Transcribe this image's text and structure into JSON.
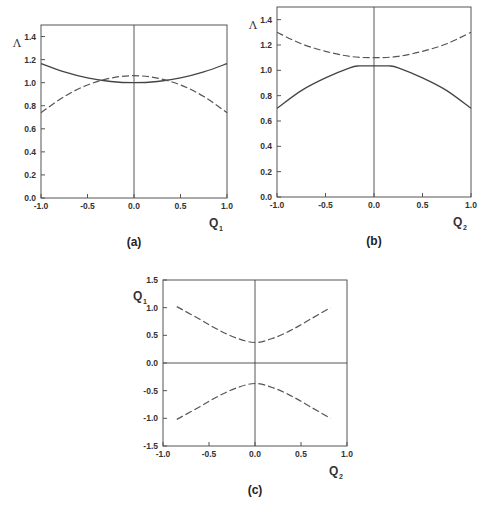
{
  "chart_data": [
    {
      "id": "a",
      "type": "line",
      "caption": "(a)",
      "xlabel": "Q",
      "xlabel_sub": "1",
      "ylabel": "Λ",
      "xlim": [
        -1.0,
        1.0
      ],
      "ylim": [
        0.0,
        1.5
      ],
      "xticks": [
        "-1.0",
        "-0.5",
        "0.0",
        "0.5",
        "1.0"
      ],
      "yticks": [
        "0.0",
        "0.2",
        "0.4",
        "0.6",
        "0.8",
        "1.0",
        "1.2",
        "1.4"
      ],
      "grid": false,
      "frame_px": {
        "left": 41,
        "right": 227,
        "top": 25,
        "bottom": 198
      },
      "series": [
        {
          "name": "solid",
          "style": "solid",
          "x": [
            -1.0,
            -0.75,
            -0.5,
            -0.25,
            0.0,
            0.25,
            0.5,
            0.75,
            1.0
          ],
          "y": [
            1.165,
            1.093,
            1.041,
            1.01,
            1.0,
            1.01,
            1.041,
            1.093,
            1.165
          ]
        },
        {
          "name": "dashed",
          "style": "dashed",
          "x": [
            -1.0,
            -0.75,
            -0.5,
            -0.25,
            0.0,
            0.25,
            0.5,
            0.75,
            1.0
          ],
          "y": [
            0.74,
            0.88,
            0.98,
            1.04,
            1.06,
            1.04,
            0.98,
            0.88,
            0.74
          ]
        }
      ]
    },
    {
      "id": "b",
      "type": "line",
      "caption": "(b)",
      "xlabel": "Q",
      "xlabel_sub": "2",
      "ylabel": "Λ",
      "xlim": [
        -1.0,
        1.0
      ],
      "ylim": [
        0.0,
        1.5
      ],
      "xticks": [
        "-1.0",
        "-0.5",
        "0.0",
        "0.5",
        "1.0"
      ],
      "yticks": [
        "0.0",
        "0.2",
        "0.4",
        "0.6",
        "0.8",
        "1.0",
        "1.2",
        "1.4"
      ],
      "grid": false,
      "frame_px": {
        "left": 277,
        "right": 471,
        "top": 7,
        "bottom": 197
      },
      "series": [
        {
          "name": "solid",
          "style": "solid",
          "x": [
            -1.0,
            -0.75,
            -0.5,
            -0.25,
            -0.15,
            0.0,
            0.15,
            0.25,
            0.5,
            0.75,
            1.0
          ],
          "y": [
            0.7,
            0.84,
            0.94,
            1.02,
            1.035,
            1.035,
            1.035,
            1.02,
            0.94,
            0.84,
            0.7
          ]
        },
        {
          "name": "dashed",
          "style": "dashed",
          "x": [
            -1.0,
            -0.75,
            -0.5,
            -0.25,
            0.0,
            0.25,
            0.5,
            0.75,
            1.0
          ],
          "y": [
            1.3,
            1.21,
            1.15,
            1.11,
            1.1,
            1.11,
            1.15,
            1.21,
            1.3
          ]
        }
      ]
    },
    {
      "id": "c",
      "type": "line",
      "caption": "(c)",
      "xlabel": "Q",
      "xlabel_sub": "2",
      "ylabel": "Q",
      "ylabel_sub": "1",
      "xlim": [
        -1.0,
        1.0
      ],
      "ylim": [
        -1.5,
        1.5
      ],
      "xticks": [
        "-1.0",
        "-0.5",
        "0.0",
        "0.5",
        "1.0"
      ],
      "yticks": [
        "-1.5",
        "-1.0",
        "-0.5",
        "0.0",
        "0.5",
        "1.0",
        "1.5"
      ],
      "grid": false,
      "frame_px": {
        "left": 163,
        "right": 347,
        "top": 280,
        "bottom": 446
      },
      "series": [
        {
          "name": "upper",
          "style": "dashed",
          "x": [
            -0.85,
            -0.6,
            -0.4,
            -0.2,
            0.0,
            0.2,
            0.4,
            0.6,
            0.82
          ],
          "y": [
            1.02,
            0.79,
            0.6,
            0.45,
            0.37,
            0.45,
            0.6,
            0.79,
            1.0
          ]
        },
        {
          "name": "lower",
          "style": "dashed",
          "x": [
            -0.85,
            -0.6,
            -0.4,
            -0.2,
            0.0,
            0.2,
            0.4,
            0.6,
            0.82
          ],
          "y": [
            -1.02,
            -0.79,
            -0.6,
            -0.45,
            -0.37,
            -0.45,
            -0.6,
            -0.79,
            -1.0
          ]
        }
      ]
    }
  ]
}
